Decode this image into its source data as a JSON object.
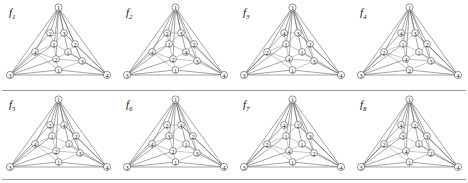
{
  "sheet": {
    "background": "#ffffff",
    "edge_color": "#7e7e86",
    "node_stroke": "#3a3a3a",
    "node_fill": "#ffffff",
    "label_color": "#15151a",
    "rule_color": "#9a9a9a",
    "rows": 2,
    "columns": 4
  },
  "figures": [
    {
      "id": "f1",
      "label": "f",
      "subscript": "1",
      "nodes": [
        {
          "name": "apex",
          "label": "1",
          "x": 58.5,
          "y": 7.5,
          "r": 3.6
        },
        {
          "name": "left-corner",
          "label": "3",
          "x": 10.0,
          "y": 75.0,
          "r": 3.6
        },
        {
          "name": "right-corner",
          "label": "4",
          "x": 107.0,
          "y": 75.0,
          "r": 3.6
        },
        {
          "name": "base-mid",
          "label": "1",
          "x": 58.5,
          "y": 70.0,
          "r": 3.4
        },
        {
          "name": "inner-a",
          "label": "2",
          "x": 50.0,
          "y": 33.0,
          "r": 3.4
        },
        {
          "name": "inner-b",
          "label": "3",
          "x": 64.0,
          "y": 33.0,
          "r": 3.4
        },
        {
          "name": "inner-c",
          "label": "1",
          "x": 54.0,
          "y": 44.0,
          "r": 3.4
        },
        {
          "name": "inner-d",
          "label": "2",
          "x": 75.0,
          "y": 44.0,
          "r": 3.4
        },
        {
          "name": "inner-e",
          "label": "4",
          "x": 35.0,
          "y": 52.0,
          "r": 3.4
        },
        {
          "name": "inner-f",
          "label": "1",
          "x": 68.0,
          "y": 52.0,
          "r": 3.4
        },
        {
          "name": "inner-g",
          "label": "2",
          "x": 56.0,
          "y": 59.0,
          "r": 3.4
        },
        {
          "name": "inner-h",
          "label": "3",
          "x": 82.0,
          "y": 61.0,
          "r": 3.4
        }
      ]
    },
    {
      "id": "f2",
      "label": "f",
      "subscript": "2",
      "nodes": [
        {
          "name": "apex",
          "label": "1",
          "x": 58.5,
          "y": 7.5,
          "r": 3.6
        },
        {
          "name": "left-corner",
          "label": "3",
          "x": 10.0,
          "y": 75.0,
          "r": 3.6
        },
        {
          "name": "right-corner",
          "label": "4",
          "x": 107.0,
          "y": 75.0,
          "r": 3.6
        },
        {
          "name": "base-mid",
          "label": "1",
          "x": 58.5,
          "y": 70.0,
          "r": 3.4
        },
        {
          "name": "inner-a",
          "label": "2",
          "x": 50.0,
          "y": 33.0,
          "r": 3.4
        },
        {
          "name": "inner-b",
          "label": "3",
          "x": 64.0,
          "y": 33.0,
          "r": 3.4
        },
        {
          "name": "inner-c",
          "label": "1",
          "x": 52.0,
          "y": 44.0,
          "r": 3.4
        },
        {
          "name": "inner-d",
          "label": "2",
          "x": 77.0,
          "y": 44.0,
          "r": 3.4
        },
        {
          "name": "inner-e",
          "label": "4",
          "x": 35.0,
          "y": 52.0,
          "r": 3.4
        },
        {
          "name": "inner-f",
          "label": "4",
          "x": 69.0,
          "y": 52.0,
          "r": 3.4
        },
        {
          "name": "inner-g",
          "label": "2",
          "x": 56.0,
          "y": 59.0,
          "r": 3.4
        },
        {
          "name": "inner-h",
          "label": "3",
          "x": 80.0,
          "y": 61.0,
          "r": 3.4
        }
      ]
    },
    {
      "id": "f3",
      "label": "f",
      "subscript": "3",
      "nodes": [
        {
          "name": "apex",
          "label": "1",
          "x": 58.5,
          "y": 7.5,
          "r": 3.6
        },
        {
          "name": "left-corner",
          "label": "3",
          "x": 10.0,
          "y": 75.0,
          "r": 3.6
        },
        {
          "name": "right-corner",
          "label": "4",
          "x": 107.0,
          "y": 75.0,
          "r": 3.6
        },
        {
          "name": "base-mid",
          "label": "1",
          "x": 58.5,
          "y": 70.0,
          "r": 3.4
        },
        {
          "name": "inner-a",
          "label": "4",
          "x": 50.0,
          "y": 33.0,
          "r": 3.4
        },
        {
          "name": "inner-b",
          "label": "3",
          "x": 64.0,
          "y": 33.0,
          "r": 3.4
        },
        {
          "name": "inner-c",
          "label": "1",
          "x": 52.0,
          "y": 44.0,
          "r": 3.4
        },
        {
          "name": "inner-d",
          "label": "2",
          "x": 76.0,
          "y": 44.0,
          "r": 3.4
        },
        {
          "name": "inner-e",
          "label": "2",
          "x": 33.0,
          "y": 52.0,
          "r": 3.4
        },
        {
          "name": "inner-f",
          "label": "1",
          "x": 68.0,
          "y": 52.0,
          "r": 3.4
        },
        {
          "name": "inner-g",
          "label": "4",
          "x": 55.0,
          "y": 59.0,
          "r": 3.4
        },
        {
          "name": "inner-h",
          "label": "3",
          "x": 80.0,
          "y": 61.0,
          "r": 3.4
        }
      ]
    },
    {
      "id": "f4",
      "label": "f",
      "subscript": "4",
      "nodes": [
        {
          "name": "apex",
          "label": "1",
          "x": 58.5,
          "y": 7.5,
          "r": 3.6
        },
        {
          "name": "left-corner",
          "label": "3",
          "x": 10.0,
          "y": 75.0,
          "r": 3.6
        },
        {
          "name": "right-corner",
          "label": "4",
          "x": 107.0,
          "y": 75.0,
          "r": 3.6
        },
        {
          "name": "base-mid",
          "label": "2",
          "x": 58.5,
          "y": 70.0,
          "r": 3.4
        },
        {
          "name": "inner-a",
          "label": "4",
          "x": 50.0,
          "y": 33.0,
          "r": 3.4
        },
        {
          "name": "inner-b",
          "label": "3",
          "x": 64.0,
          "y": 33.0,
          "r": 3.4
        },
        {
          "name": "inner-c",
          "label": "1",
          "x": 52.0,
          "y": 44.0,
          "r": 3.4
        },
        {
          "name": "inner-d",
          "label": "2",
          "x": 76.0,
          "y": 44.0,
          "r": 3.4
        },
        {
          "name": "inner-e",
          "label": "2",
          "x": 33.0,
          "y": 52.0,
          "r": 3.4
        },
        {
          "name": "inner-f",
          "label": "1",
          "x": 68.0,
          "y": 52.0,
          "r": 3.4
        },
        {
          "name": "inner-g",
          "label": "4",
          "x": 55.0,
          "y": 59.0,
          "r": 3.4
        },
        {
          "name": "inner-h",
          "label": "3",
          "x": 80.0,
          "y": 61.0,
          "r": 3.4
        }
      ]
    },
    {
      "id": "f5",
      "label": "f",
      "subscript": "5",
      "nodes": [
        {
          "name": "apex",
          "label": "1",
          "x": 58.5,
          "y": 7.5,
          "r": 3.6
        },
        {
          "name": "left-corner",
          "label": "3",
          "x": 10.0,
          "y": 75.0,
          "r": 3.6
        },
        {
          "name": "right-corner",
          "label": "4",
          "x": 107.0,
          "y": 75.0,
          "r": 3.6
        },
        {
          "name": "base-mid",
          "label": "1",
          "x": 58.5,
          "y": 70.0,
          "r": 3.4
        },
        {
          "name": "inner-a",
          "label": "2",
          "x": 50.0,
          "y": 33.0,
          "r": 3.4
        },
        {
          "name": "inner-b",
          "label": "4",
          "x": 64.0,
          "y": 33.0,
          "r": 3.4
        },
        {
          "name": "inner-c",
          "label": "1",
          "x": 52.0,
          "y": 44.0,
          "r": 3.4
        },
        {
          "name": "inner-d",
          "label": "2",
          "x": 76.0,
          "y": 44.0,
          "r": 3.4
        },
        {
          "name": "inner-e",
          "label": "4",
          "x": 35.0,
          "y": 52.0,
          "r": 3.4
        },
        {
          "name": "inner-f",
          "label": "1",
          "x": 69.0,
          "y": 52.0,
          "r": 3.4
        },
        {
          "name": "inner-g",
          "label": "2",
          "x": 56.0,
          "y": 59.0,
          "r": 3.4
        },
        {
          "name": "inner-h",
          "label": "3",
          "x": 80.0,
          "y": 61.0,
          "r": 3.4
        }
      ]
    },
    {
      "id": "f6",
      "label": "f",
      "subscript": "6",
      "nodes": [
        {
          "name": "apex",
          "label": "1",
          "x": 58.5,
          "y": 7.5,
          "r": 3.6
        },
        {
          "name": "left-corner",
          "label": "3",
          "x": 10.0,
          "y": 75.0,
          "r": 3.6
        },
        {
          "name": "right-corner",
          "label": "4",
          "x": 107.0,
          "y": 75.0,
          "r": 3.6
        },
        {
          "name": "base-mid",
          "label": "1",
          "x": 58.5,
          "y": 70.0,
          "r": 3.4
        },
        {
          "name": "inner-a",
          "label": "2",
          "x": 50.0,
          "y": 33.0,
          "r": 3.4
        },
        {
          "name": "inner-b",
          "label": "4",
          "x": 64.0,
          "y": 33.0,
          "r": 3.4
        },
        {
          "name": "inner-c",
          "label": "3",
          "x": 52.0,
          "y": 44.0,
          "r": 3.4
        },
        {
          "name": "inner-d",
          "label": "2",
          "x": 76.0,
          "y": 44.0,
          "r": 3.4
        },
        {
          "name": "inner-e",
          "label": "4",
          "x": 35.0,
          "y": 52.0,
          "r": 3.4
        },
        {
          "name": "inner-f",
          "label": "1",
          "x": 69.0,
          "y": 52.0,
          "r": 3.4
        },
        {
          "name": "inner-g",
          "label": "2",
          "x": 56.0,
          "y": 59.0,
          "r": 3.4
        },
        {
          "name": "inner-h",
          "label": "3",
          "x": 80.0,
          "y": 61.0,
          "r": 3.4
        }
      ]
    },
    {
      "id": "f7",
      "label": "f",
      "subscript": "7",
      "nodes": [
        {
          "name": "apex",
          "label": "1",
          "x": 58.5,
          "y": 7.5,
          "r": 3.6
        },
        {
          "name": "left-corner",
          "label": "3",
          "x": 10.0,
          "y": 75.0,
          "r": 3.6
        },
        {
          "name": "right-corner",
          "label": "4",
          "x": 107.0,
          "y": 75.0,
          "r": 3.6
        },
        {
          "name": "base-mid",
          "label": "1",
          "x": 58.5,
          "y": 70.0,
          "r": 3.4
        },
        {
          "name": "inner-a",
          "label": "4",
          "x": 50.0,
          "y": 33.0,
          "r": 3.4
        },
        {
          "name": "inner-b",
          "label": "2",
          "x": 64.0,
          "y": 33.0,
          "r": 3.4
        },
        {
          "name": "inner-c",
          "label": "1",
          "x": 52.0,
          "y": 44.0,
          "r": 3.4
        },
        {
          "name": "inner-d",
          "label": "3",
          "x": 76.0,
          "y": 44.0,
          "r": 3.4
        },
        {
          "name": "inner-e",
          "label": "2",
          "x": 33.0,
          "y": 52.0,
          "r": 3.4
        },
        {
          "name": "inner-f",
          "label": "1",
          "x": 68.0,
          "y": 52.0,
          "r": 3.4
        },
        {
          "name": "inner-g",
          "label": "4",
          "x": 55.0,
          "y": 59.0,
          "r": 3.4
        },
        {
          "name": "inner-h",
          "label": "2",
          "x": 80.0,
          "y": 61.0,
          "r": 3.4
        }
      ]
    },
    {
      "id": "f8",
      "label": "f",
      "subscript": "8",
      "nodes": [
        {
          "name": "apex",
          "label": "1",
          "x": 58.5,
          "y": 7.5,
          "r": 3.6
        },
        {
          "name": "left-corner",
          "label": "3",
          "x": 10.0,
          "y": 75.0,
          "r": 3.6
        },
        {
          "name": "right-corner",
          "label": "4",
          "x": 107.0,
          "y": 75.0,
          "r": 3.6
        },
        {
          "name": "base-mid",
          "label": "1",
          "x": 58.5,
          "y": 70.0,
          "r": 3.4
        },
        {
          "name": "inner-a",
          "label": "4",
          "x": 50.0,
          "y": 33.0,
          "r": 3.4
        },
        {
          "name": "inner-b",
          "label": "2",
          "x": 64.0,
          "y": 33.0,
          "r": 3.4
        },
        {
          "name": "inner-c",
          "label": "3",
          "x": 52.0,
          "y": 44.0,
          "r": 3.4
        },
        {
          "name": "inner-d",
          "label": "3",
          "x": 76.0,
          "y": 44.0,
          "r": 3.4
        },
        {
          "name": "inner-e",
          "label": "2",
          "x": 33.0,
          "y": 52.0,
          "r": 3.4
        },
        {
          "name": "inner-f",
          "label": "1",
          "x": 68.0,
          "y": 52.0,
          "r": 3.4
        },
        {
          "name": "inner-g",
          "label": "4",
          "x": 55.0,
          "y": 59.0,
          "r": 3.4
        },
        {
          "name": "inner-h",
          "label": "2",
          "x": 80.0,
          "y": 61.0,
          "r": 3.4
        }
      ]
    }
  ],
  "edges": [
    [
      "apex",
      "left-corner"
    ],
    [
      "apex",
      "right-corner"
    ],
    [
      "left-corner",
      "right-corner"
    ],
    [
      "apex",
      "inner-a"
    ],
    [
      "apex",
      "inner-b"
    ],
    [
      "apex",
      "inner-c"
    ],
    [
      "apex",
      "inner-d"
    ],
    [
      "apex",
      "inner-e"
    ],
    [
      "apex",
      "inner-f"
    ],
    [
      "apex",
      "inner-g"
    ],
    [
      "apex",
      "inner-h"
    ],
    [
      "inner-a",
      "inner-b"
    ],
    [
      "inner-a",
      "inner-c"
    ],
    [
      "inner-b",
      "inner-c"
    ],
    [
      "inner-b",
      "inner-d"
    ],
    [
      "inner-c",
      "inner-e"
    ],
    [
      "inner-c",
      "inner-f"
    ],
    [
      "inner-c",
      "inner-g"
    ],
    [
      "inner-d",
      "inner-f"
    ],
    [
      "inner-d",
      "inner-h"
    ],
    [
      "inner-e",
      "inner-g"
    ],
    [
      "inner-f",
      "inner-g"
    ],
    [
      "inner-f",
      "inner-h"
    ],
    [
      "inner-g",
      "inner-h"
    ],
    [
      "inner-g",
      "base-mid"
    ],
    [
      "inner-h",
      "base-mid"
    ],
    [
      "inner-e",
      "base-mid"
    ],
    [
      "left-corner",
      "inner-e"
    ],
    [
      "left-corner",
      "inner-a"
    ],
    [
      "left-corner",
      "inner-c"
    ],
    [
      "left-corner",
      "inner-g"
    ],
    [
      "left-corner",
      "base-mid"
    ],
    [
      "right-corner",
      "inner-h"
    ],
    [
      "right-corner",
      "inner-d"
    ],
    [
      "right-corner",
      "inner-b"
    ],
    [
      "right-corner",
      "inner-f"
    ],
    [
      "right-corner",
      "base-mid"
    ]
  ]
}
